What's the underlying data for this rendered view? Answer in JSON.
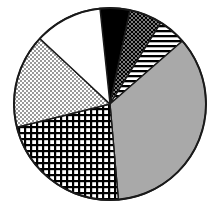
{
  "chart_data": {
    "type": "pie",
    "title": "",
    "subtitle": "",
    "xlabel": "",
    "ylabel": "",
    "grid": false,
    "legend_position": "none",
    "start_angle_deg": -6,
    "direction": "clockwise",
    "center": {
      "x": 110,
      "y": 104
    },
    "radius": 96,
    "categories": [
      "Segment 1",
      "Segment 2",
      "Segment 3",
      "Segment 4",
      "Segment 5",
      "Segment 6",
      "Segment 7"
    ],
    "values": [
      5.0,
      5.6,
      4.7,
      35.0,
      22.5,
      15.8,
      11.4
    ],
    "units": "percent",
    "total": 100.0,
    "slices": [
      {
        "label": "Segment 1",
        "value": 5.0,
        "fill_style": "solid-black",
        "fill_color": "#000000",
        "start_deg": -6,
        "end_deg": 12
      },
      {
        "label": "Segment 2",
        "value": 5.6,
        "fill_style": "diagonal-crosshatch-dense",
        "fill_color": "#3a3a3a",
        "start_deg": 12,
        "end_deg": 32
      },
      {
        "label": "Segment 3",
        "value": 4.7,
        "fill_style": "horizontal-stripes",
        "fill_color": "#2b2b2b",
        "start_deg": 32,
        "end_deg": 49
      },
      {
        "label": "Segment 4",
        "value": 35.0,
        "fill_style": "solid-gray",
        "fill_color": "#a9a9a9",
        "start_deg": 49,
        "end_deg": 175
      },
      {
        "label": "Segment 5",
        "value": 22.5,
        "fill_style": "square-grid",
        "fill_color": "#545454",
        "start_deg": 175,
        "end_deg": 256
      },
      {
        "label": "Segment 6",
        "value": 15.8,
        "fill_style": "fine-dots-light",
        "fill_color": "#d8d8d8",
        "start_deg": 256,
        "end_deg": 313
      },
      {
        "label": "Segment 7",
        "value": 11.4,
        "fill_style": "solid-white",
        "fill_color": "#ffffff",
        "start_deg": 313,
        "end_deg": 354
      }
    ],
    "outline_color": "#1a1a1a"
  }
}
